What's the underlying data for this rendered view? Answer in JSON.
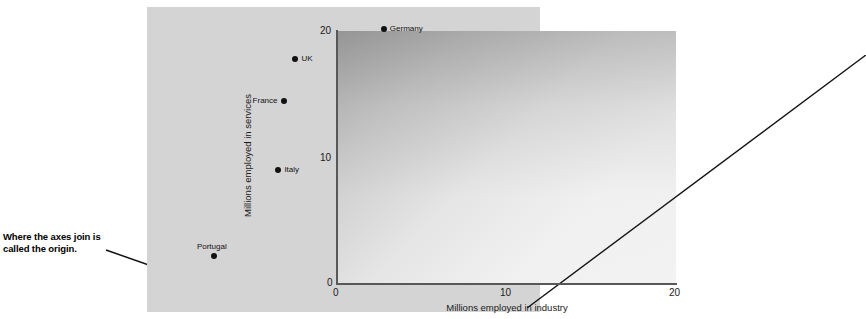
{
  "annotation": {
    "line1": "Where the axes join is",
    "line2": "called the origin."
  },
  "chart_data": {
    "type": "scatter",
    "title": "",
    "xlabel": "Millions employed in industry",
    "ylabel": "Millions employed in services",
    "xlim": [
      0,
      20
    ],
    "ylim": [
      0,
      20
    ],
    "xticks": [
      "0",
      "10",
      "20"
    ],
    "yticks": [
      "0",
      "10",
      "20"
    ],
    "xtick_values": [
      0,
      10,
      20
    ],
    "ytick_values": [
      0,
      10,
      20
    ],
    "grid": false,
    "legend": "none",
    "reference_line": {
      "name": "y = x (45 degree line)",
      "from": [
        0,
        0
      ],
      "to": [
        20,
        20
      ]
    },
    "points": [
      {
        "label": "Germany",
        "x": 11.4,
        "y": 19.7,
        "label_side": "right"
      },
      {
        "label": "UK",
        "x": 6.2,
        "y": 17.3,
        "label_side": "right"
      },
      {
        "label": "France",
        "x": 5.5,
        "y": 14.0,
        "label_side": "left"
      },
      {
        "label": "Italy",
        "x": 5.2,
        "y": 8.5,
        "label_side": "right"
      },
      {
        "label": "Portugal",
        "x": 1.4,
        "y": 1.7,
        "label_side": "above"
      }
    ]
  },
  "colors": {
    "figure_background": "#d4d4d4",
    "axis": "#58585a",
    "point": "#111111",
    "text": "#1a1a1a",
    "page_background": "#ffffff"
  }
}
